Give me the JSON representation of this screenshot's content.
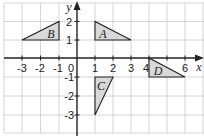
{
  "diagram": {
    "type": "coordinate-grid",
    "axes": {
      "x_label": "x",
      "y_label": "y",
      "x_ticks": [
        "-3",
        "-2",
        "-1",
        "0",
        "1",
        "2",
        "3",
        "4",
        "5",
        "6"
      ],
      "y_ticks": [
        "2",
        "1",
        "-1",
        "-2",
        "-3"
      ],
      "origin_label": "0"
    },
    "shapes": [
      {
        "label": "A",
        "vertices": [
          [
            1,
            2
          ],
          [
            1,
            1
          ],
          [
            3,
            1
          ]
        ],
        "fill": "#d9d9d9"
      },
      {
        "label": "B",
        "vertices": [
          [
            -3,
            1
          ],
          [
            -1,
            2
          ],
          [
            -1,
            1
          ]
        ],
        "fill": "#d9d9d9"
      },
      {
        "label": "C",
        "vertices": [
          [
            1,
            -1
          ],
          [
            2,
            -1
          ],
          [
            1,
            -3
          ]
        ],
        "fill": "#d9d9d9"
      },
      {
        "label": "D",
        "vertices": [
          [
            4,
            0
          ],
          [
            4,
            -1
          ],
          [
            6,
            -1
          ]
        ],
        "fill": "#d9d9d9"
      }
    ],
    "colors": {
      "grid": "#c9c9c9",
      "axis": "#222222",
      "shade": "#d9d9d9"
    }
  }
}
